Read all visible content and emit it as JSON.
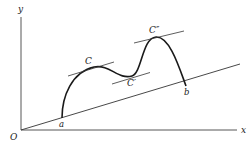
{
  "diagram": {
    "type": "mean-value-theorem-curve",
    "axes": {
      "x_label": "x",
      "y_label": "y",
      "origin_label": "O"
    },
    "endpoints": {
      "start_label": "a",
      "end_label": "b"
    },
    "tangent_points": [
      {
        "label": "C"
      },
      {
        "label": "C′"
      },
      {
        "label": "C″"
      }
    ]
  }
}
